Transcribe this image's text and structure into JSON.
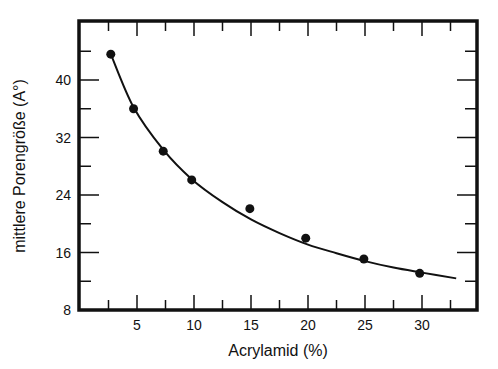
{
  "chart_data": {
    "type": "scatter",
    "title": "",
    "xlabel": "Acrylamid (%)",
    "ylabel": "mittlere Porengröße (A°)",
    "xlim": [
      0,
      35
    ],
    "ylim": [
      8,
      48
    ],
    "x_ticks": [
      5,
      10,
      15,
      20,
      25,
      30
    ],
    "y_ticks": [
      8,
      16,
      24,
      32,
      40
    ],
    "grid": false,
    "legend": null,
    "series": [
      {
        "name": "Messwerte",
        "type": "scatter",
        "x": [
          2.7,
          4.7,
          7.3,
          9.8,
          14.9,
          19.8,
          24.9,
          29.8
        ],
        "y": [
          43.6,
          36.0,
          30.1,
          26.1,
          22.1,
          18.0,
          15.1,
          13.1
        ]
      },
      {
        "name": "Fit-Kurve",
        "type": "line",
        "x": [
          2.7,
          4.7,
          7.3,
          9.8,
          12.5,
          15,
          17.5,
          20,
          22.5,
          25,
          27.5,
          30,
          33
        ],
        "y": [
          43.6,
          36.2,
          30.3,
          26.2,
          23.0,
          20.6,
          18.7,
          17.1,
          15.9,
          14.8,
          13.9,
          13.2,
          12.4
        ]
      }
    ]
  }
}
